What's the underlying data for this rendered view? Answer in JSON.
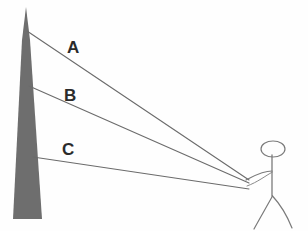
{
  "diagram": {
    "background_color": "#fefefe",
    "line_color": "#6b6b6b",
    "figure_color": "#7a7a7a",
    "tower_color": "#6e6e6e",
    "label_color": "#2b2b2b",
    "labels": [
      {
        "id": "A",
        "text": "A",
        "x": 67,
        "y": 39
      },
      {
        "id": "B",
        "text": "B",
        "x": 64,
        "y": 87
      },
      {
        "id": "C",
        "text": "C",
        "x": 62,
        "y": 141
      }
    ],
    "tower": {
      "name": "tower",
      "apex_x": 26,
      "apex_y": 7,
      "base_left_x": 13,
      "base_right_x": 42,
      "base_y": 219,
      "shoulder_x": 30,
      "shoulder_y": 40
    },
    "observer": {
      "name": "stick-figure-observer",
      "eye_x": 249,
      "eye_y": 183,
      "head_cx": 273,
      "head_cy": 149,
      "head_rx": 12,
      "head_ry": 8,
      "body_top_y": 155,
      "body_bottom_y": 196,
      "body_x": 272,
      "shoulder_y": 171,
      "leg_left_x": 252,
      "leg_right_x": 292,
      "leg_y": 228
    },
    "sight_lines": [
      {
        "id": "A",
        "name": "sight-line-a",
        "from_x": 27,
        "from_y": 31,
        "to_x": 249,
        "to_y": 180,
        "description": "Line of sight from observer to tower top"
      },
      {
        "id": "B",
        "name": "sight-line-b",
        "from_x": 29,
        "from_y": 86,
        "to_x": 249,
        "to_y": 183,
        "description": "Line of sight from observer to tower middle"
      },
      {
        "id": "C",
        "name": "sight-line-c",
        "from_x": 33,
        "from_y": 157,
        "to_x": 249,
        "to_y": 189,
        "description": "Line of sight from observer to tower lower section"
      }
    ]
  }
}
